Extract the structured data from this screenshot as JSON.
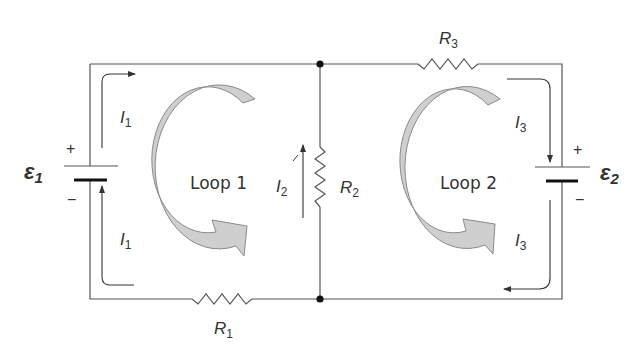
{
  "diagram": {
    "type": "circuit",
    "emfs": [
      {
        "symbol": "ε",
        "sub": "1",
        "plus": "+",
        "minus": "−"
      },
      {
        "symbol": "ε",
        "sub": "2",
        "plus": "+",
        "minus": "−"
      }
    ],
    "resistors": [
      {
        "symbol": "R",
        "sub": "1"
      },
      {
        "symbol": "R",
        "sub": "2"
      },
      {
        "symbol": "R",
        "sub": "3"
      }
    ],
    "currents": {
      "i1_top": {
        "symbol": "I",
        "sub": "1"
      },
      "i1_bottom": {
        "symbol": "I",
        "sub": "1"
      },
      "i2": {
        "symbol": "I",
        "sub": "2"
      },
      "i3_top": {
        "symbol": "I",
        "sub": "3"
      },
      "i3_bottom": {
        "symbol": "I",
        "sub": "3"
      }
    },
    "loops": [
      {
        "label": "Loop 1"
      },
      {
        "label": "Loop 2"
      }
    ],
    "colors": {
      "wire": "#555555",
      "loop_arrow_fill": "#cfcfcf",
      "loop_arrow_stroke": "#8a8a8a",
      "text": "#333333"
    }
  }
}
